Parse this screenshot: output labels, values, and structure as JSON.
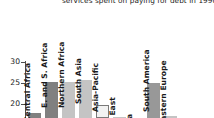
{
  "chart_data": {
    "type": "bar",
    "title": "services spent on paying for debt in 1990",
    "title_lines": [
      "",
      "services spent on paying for debt in 1990"
    ],
    "xlabel": "",
    "ylabel": "",
    "ylim": [
      15,
      32
    ],
    "grid": false,
    "legend": null,
    "ytick_labels": [
      "30",
      "25",
      "20"
    ],
    "ytick_values": [
      30,
      25,
      20
    ],
    "categories": [
      "Central Africa",
      "E. and S. Africa",
      "Northern Africa",
      "South Asia",
      "Asia-Pacific",
      "Middle East",
      "Central Asia",
      "South America",
      "Eastern Europe"
    ],
    "category_labels_visible": [
      "Central Africa",
      "E. and S. Africa",
      "Northern Africa",
      "South Asia",
      "Asia-Pacific",
      "le East",
      "sia",
      "South America",
      "Eastern Europe"
    ],
    "values": [
      18.2,
      25.9,
      26.0,
      26.6,
      19.2,
      16.4,
      15.9,
      25.8,
      16.1
    ],
    "bar_colors": [
      "#808080",
      "#808080",
      "#c4c4c4",
      "#c4c4c4",
      "#f2f2f2",
      "#c4c4c4",
      "#c4c4c4",
      "#989898",
      "#c4c4c4"
    ],
    "bar_edge_color": "#7a7a7a",
    "axis_color": "#4d4d4d",
    "text_color": "#1a1a1a",
    "background": "#ffffff",
    "note": "chart is cropped: first title line and lower portion of y-axis are cut off"
  },
  "axis": {
    "y_ticks": [
      {
        "label": "30",
        "top": 58
      },
      {
        "label": "25",
        "top": 79
      },
      {
        "label": "20",
        "top": 100
      }
    ]
  },
  "bars": [
    {
      "name": "Central Africa",
      "label": "Central Africa",
      "left": 28,
      "width": 13,
      "top": 113,
      "color": "#808080"
    },
    {
      "name": "E. and S. Africa",
      "label": "E. and S. Africa",
      "left": 45,
      "width": 13,
      "top": 82,
      "color": "#808080"
    },
    {
      "name": "Northern Africa",
      "label": "Northern Africa",
      "left": 62,
      "width": 13,
      "top": 82,
      "color": "#c4c4c4"
    },
    {
      "name": "South Asia",
      "label": "South Asia",
      "left": 79,
      "width": 13,
      "top": 80,
      "color": "#c4c4c4"
    },
    {
      "name": "Asia-Pacific",
      "label": "Asia-Pacific",
      "left": 96,
      "width": 13,
      "top": 105,
      "color": "#f2f2f2"
    },
    {
      "name": "Middle East",
      "label": "le East",
      "left": 113,
      "width": 13,
      "top": 117,
      "color": "#c4c4c4"
    },
    {
      "name": "Central Asia",
      "label": "sia",
      "left": 130,
      "width": 13,
      "top": 118,
      "color": "#c4c4c4"
    },
    {
      "name": "South America",
      "label": "South America",
      "left": 147,
      "width": 13,
      "top": 83,
      "color": "#989898"
    },
    {
      "name": "Eastern Europe",
      "label": "Eastern Europe",
      "left": 164,
      "width": 13,
      "top": 116,
      "color": "#c4c4c4"
    }
  ],
  "labels": [
    {
      "text": "Central Africa",
      "x": 32,
      "y": 114
    },
    {
      "text": "E. and S. Africa",
      "x": 49,
      "y": 100
    },
    {
      "text": "Northern Africa",
      "x": 66,
      "y": 100
    },
    {
      "text": "South Asia",
      "x": 83,
      "y": 96
    },
    {
      "text": "Asia-Pacific",
      "x": 100,
      "y": 104
    },
    {
      "text": "le East",
      "x": 117,
      "y": 118
    },
    {
      "text": "sia",
      "x": 134,
      "y": 118
    },
    {
      "text": "South America",
      "x": 151,
      "y": 104
    },
    {
      "text": "Eastern Europe",
      "x": 168,
      "y": 118
    }
  ]
}
